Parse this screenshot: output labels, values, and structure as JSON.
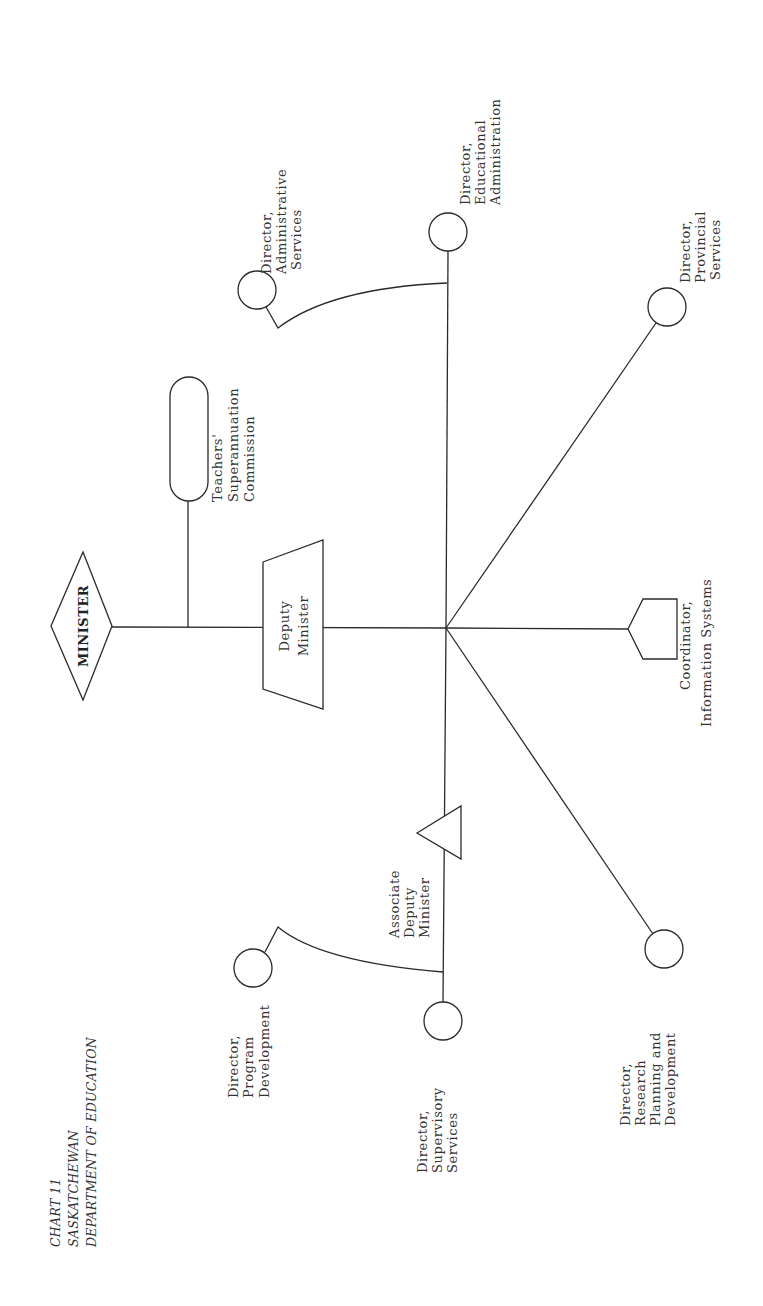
{
  "title": {
    "line1": "CHART 11",
    "line2": "SASKATCHEWAN",
    "line3": "DEPARTMENT OF EDUCATION"
  },
  "orientation": "rotated 90 degrees counter-clockwise",
  "nodes": {
    "minister": {
      "label": "MINISTER",
      "shape": "diamond"
    },
    "deputy_minister": {
      "line1": "Deputy",
      "line2": "Minister",
      "shape": "trapezoid"
    },
    "teachers_commission": {
      "line1": "Teachers'",
      "line2": "Superannuation",
      "line3": "Commission",
      "shape": "rounded-rectangle"
    },
    "associate_deputy": {
      "line1": "Associate",
      "line2": "Deputy",
      "line3": "Minister",
      "shape": "triangle"
    },
    "coordinator_info": {
      "line1": "Coordinator,",
      "line2": "Information Systems",
      "shape": "pentagon"
    },
    "dir_admin_services": {
      "line1": "Director,",
      "line2": "Administrative",
      "line3": "Services",
      "shape": "circle"
    },
    "dir_educational_admin": {
      "line1": "Director,",
      "line2": "Educational",
      "line3": "Administration",
      "shape": "circle"
    },
    "dir_provincial_services": {
      "line1": "Director,",
      "line2": "Provincial",
      "line3": "Services",
      "shape": "circle"
    },
    "dir_research": {
      "line1": "Director,",
      "line2": "Research",
      "line3": "Planning  and",
      "line4": "Development",
      "shape": "circle"
    },
    "dir_program_dev": {
      "line1": "Director,",
      "line2": "Program",
      "line3": "Development",
      "shape": "circle"
    },
    "dir_supervisory": {
      "line1": "Director,",
      "line2": "Supervisory",
      "line3": "Services",
      "shape": "circle"
    }
  },
  "edges": [
    [
      "minister",
      "deputy_minister"
    ],
    [
      "minister",
      "teachers_commission"
    ],
    [
      "deputy_minister",
      "dir_educational_admin"
    ],
    [
      "deputy_minister",
      "dir_admin_services"
    ],
    [
      "deputy_minister",
      "dir_provincial_services"
    ],
    [
      "deputy_minister",
      "coordinator_info"
    ],
    [
      "deputy_minister",
      "dir_research"
    ],
    [
      "deputy_minister",
      "associate_deputy"
    ],
    [
      "associate_deputy",
      "dir_program_dev"
    ],
    [
      "associate_deputy",
      "dir_supervisory"
    ]
  ],
  "colors": {
    "ink": "#2a2a2a",
    "paper": "#ffffff"
  }
}
